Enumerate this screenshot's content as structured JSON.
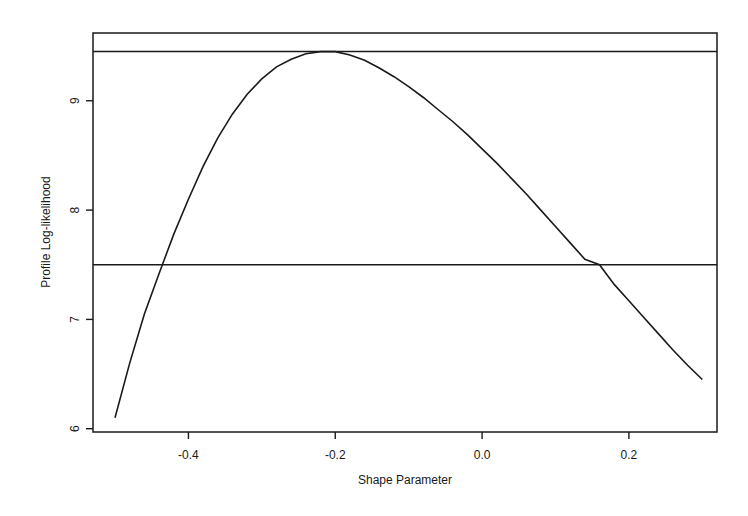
{
  "chart_data": {
    "type": "line",
    "title": "",
    "xlabel": "Shape Parameter",
    "ylabel": "Profile Log-likelihood",
    "xlim": [
      -0.53,
      0.32
    ],
    "ylim": [
      5.97,
      9.62
    ],
    "grid": false,
    "legend": null,
    "x_ticks": [
      -0.4,
      -0.2,
      0.0,
      0.2
    ],
    "x_tick_labels": [
      "-0.4",
      "-0.2",
      "0.0",
      "0.2"
    ],
    "y_ticks": [
      6,
      7,
      8,
      9
    ],
    "y_tick_labels": [
      "6",
      "7",
      "8",
      "9"
    ],
    "series": [
      {
        "name": "profile log-likelihood",
        "x": [
          -0.5,
          -0.48,
          -0.46,
          -0.44,
          -0.42,
          -0.4,
          -0.38,
          -0.36,
          -0.34,
          -0.32,
          -0.3,
          -0.28,
          -0.26,
          -0.24,
          -0.22,
          -0.21,
          -0.2,
          -0.18,
          -0.16,
          -0.14,
          -0.12,
          -0.1,
          -0.08,
          -0.06,
          -0.04,
          -0.02,
          0.0,
          0.02,
          0.04,
          0.06,
          0.08,
          0.1,
          0.12,
          0.14,
          0.16,
          0.18,
          0.2,
          0.22,
          0.24,
          0.26,
          0.28,
          0.3
        ],
        "y": [
          6.1,
          6.6,
          7.05,
          7.42,
          7.78,
          8.1,
          8.4,
          8.66,
          8.88,
          9.06,
          9.2,
          9.31,
          9.38,
          9.43,
          9.45,
          9.45,
          9.45,
          9.42,
          9.37,
          9.3,
          9.22,
          9.13,
          9.03,
          8.92,
          8.81,
          8.69,
          8.56,
          8.43,
          8.29,
          8.15,
          8.0,
          7.85,
          7.7,
          7.55,
          7.5,
          7.32,
          7.17,
          7.02,
          6.87,
          6.72,
          6.58,
          6.45
        ]
      }
    ],
    "reference_lines": [
      {
        "name": "maximum-log-likelihood",
        "orientation": "horizontal",
        "y": 9.45
      },
      {
        "name": "confidence-cutoff",
        "orientation": "horizontal",
        "y": 7.5
      }
    ],
    "annotations": []
  }
}
